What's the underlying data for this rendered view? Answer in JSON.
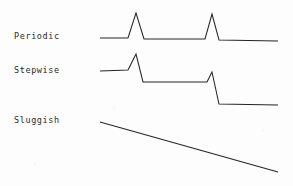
{
  "figure": {
    "background_color": "#fdfdfd",
    "line_color": "#262626",
    "text_color": "#2a2a2a",
    "width": 293,
    "height": 186
  },
  "rows": [
    {
      "label": "Periodic",
      "description": "flat baseline with two identical spikes returning to the same level"
    },
    {
      "label": "Stepwise",
      "description": "two spikes, each dropping to a progressively lower baseline"
    },
    {
      "label": "Sluggish",
      "description": "single straight line declining steadily"
    }
  ],
  "chart_data": {
    "type": "line",
    "title": "",
    "xlabel": "",
    "ylabel": "",
    "grid": false,
    "legend": "left-row-labels",
    "xlim": [
      100,
      278
    ],
    "series": [
      {
        "name": "Periodic",
        "points": "100,38 128,38 136,13 144,39 205,39 212,14 219,40 278,41"
      },
      {
        "name": "Stepwise",
        "points": "100,71 128,70 136,54 143,82 207,82 212,72 219,104 278,105"
      },
      {
        "name": "Sluggish",
        "points": "100,122 278,172"
      }
    ]
  }
}
